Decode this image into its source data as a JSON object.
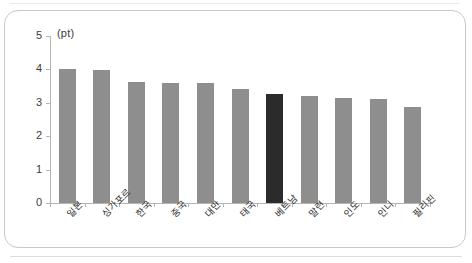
{
  "chart_data": {
    "type": "bar",
    "title": "",
    "subtitle": "",
    "xlabel": "",
    "ylabel": "",
    "unit_label": "(pt)",
    "ylim": [
      0,
      5
    ],
    "ytick_labels": [
      "0",
      "1",
      "2",
      "3",
      "4",
      "5"
    ],
    "ytick_values": [
      0,
      1,
      2,
      3,
      4,
      5
    ],
    "grid": false,
    "legend": "none",
    "categories": [
      "일본",
      "싱가포르",
      "한국",
      "중국",
      "대만",
      "태국",
      "베트남",
      "말련",
      "인도",
      "인니",
      "필리핀"
    ],
    "values": [
      4.02,
      3.98,
      3.61,
      3.6,
      3.58,
      3.4,
      3.27,
      3.19,
      3.15,
      3.11,
      2.86
    ],
    "highlight_index": 6,
    "highlight_category": "베트남",
    "colors": {
      "bar": "#8e8e8e",
      "bar_highlight": "#2b2b2b",
      "axis": "#b5b5b5",
      "text": "#2e2e2e",
      "frame": "#c9c9c9",
      "background": "#ffffff"
    }
  }
}
